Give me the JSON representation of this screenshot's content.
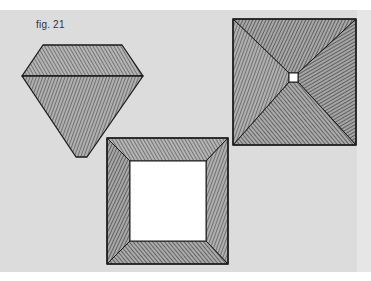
{
  "figure": {
    "label": "fig. 21",
    "shapes": [
      {
        "name": "gem",
        "description": "faceted diamond/gem shape with hatched crown and pavilion"
      },
      {
        "name": "pyramid-square",
        "description": "square with diagonals to a small central white square, fully hatched"
      },
      {
        "name": "frame-square",
        "description": "square frame with mitered hatched borders and white center"
      }
    ]
  },
  "colors": {
    "page": "#dcdcdc",
    "ink": "#1a1a1a",
    "hatch_fill": "#8a8a8a",
    "white": "#ffffff"
  }
}
